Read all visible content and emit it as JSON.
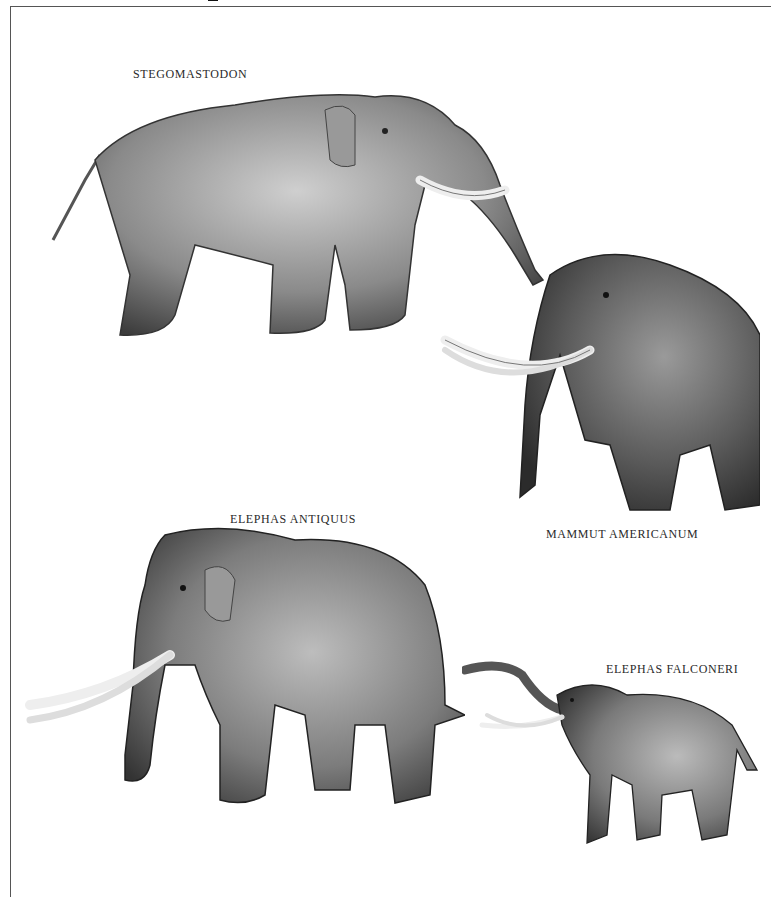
{
  "page": {
    "type": "book plate",
    "background": "#ffffff",
    "frame_color": "#555555"
  },
  "captions": {
    "stegomastodon": "STEGOMASTODON",
    "mammut": "MAMMUT AMERICANUM",
    "antiquus": "ELEPHAS ANTIQUUS",
    "falconeri": "ELEPHAS FALCONERI"
  },
  "illustrations": [
    {
      "name": "Stegomastodon",
      "facing": "right",
      "trunk": "hanging forward",
      "tusks": "upcurved"
    },
    {
      "name": "Mammut americanum",
      "facing": "left",
      "coat": "shaggy",
      "tusks": "long curved"
    },
    {
      "name": "Elephas antiquus",
      "facing": "left",
      "tusks": "long straight"
    },
    {
      "name": "Elephas falconeri",
      "facing": "left",
      "trunk": "raised",
      "size": "dwarf"
    }
  ]
}
